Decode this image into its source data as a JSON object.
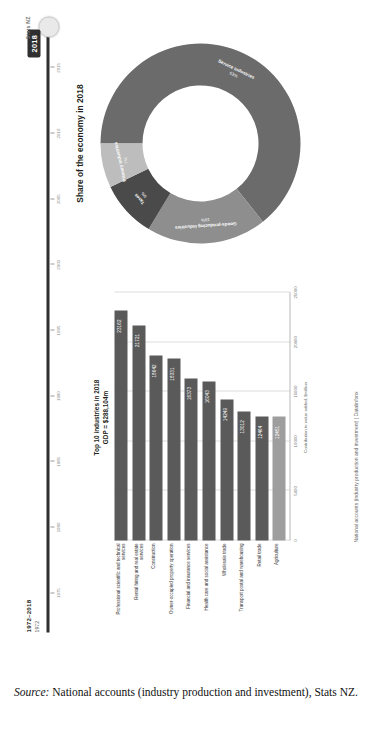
{
  "timeline": {
    "range_label": "1972–2018",
    "start_year": "1972",
    "selected_year": "2018",
    "ticks": [
      "1975",
      "1980",
      "1985",
      "1990",
      "1995",
      "2000",
      "2005",
      "2010",
      "2015"
    ]
  },
  "bar_chart": {
    "title_line1": "Top 10 industries in 2018",
    "title_line2": "GDP = $288,104m",
    "xlabel": "Contribution to value added, $million",
    "xticks": [
      "0",
      "5000",
      "10000",
      "15000",
      "20000",
      "25000"
    ],
    "xmax": 25000
  },
  "chart_data": [
    {
      "type": "bar",
      "orientation": "horizontal",
      "title": "Top 10 industries in 2018  GDP = $288,104m",
      "xlabel": "Contribution to value added, $million",
      "ylabel": "",
      "xlim": [
        0,
        25000
      ],
      "grid": true,
      "categories": [
        "Professional scientific and technical services",
        "Rental hiring and real estate services",
        "Construction",
        "Owner-occupied property operation",
        "Financial and insurance services",
        "Health care and social assistance",
        "Wholesale trade",
        "Transport postal and warehousing",
        "Retail trade",
        "Agriculture"
      ],
      "values": [
        23162,
        21721,
        18642,
        18331,
        16373,
        16043,
        14249,
        13012,
        12464,
        12451
      ],
      "value_labels": [
        "23162",
        "21721",
        "18642",
        "18331",
        "16373",
        "16043",
        "14249",
        "13012",
        "12464",
        "12451"
      ],
      "highlight_index": 9,
      "colors": {
        "bar": "#5a5a5a",
        "highlight": "#9e9e9e"
      }
    },
    {
      "type": "pie",
      "variant": "donut",
      "title": "Share of the economy in 2018",
      "legend": "labels-on-slices",
      "labels": [
        "Service industries",
        "Goods-producing industries",
        "Taxes",
        "Primary industries"
      ],
      "values": [
        63,
        19,
        9,
        7
      ],
      "value_labels": [
        "63%",
        "19%",
        "9%",
        "7%"
      ],
      "colors": [
        "#6b6b6b",
        "#8e8e8e",
        "#4a4a4a",
        "#bdbdbd"
      ]
    }
  ],
  "footer": {
    "infographic_note": "National accounts (industry production and investment) | Datalinfonx",
    "brand": "Stats NZ"
  },
  "caption": {
    "source_label": "Source:",
    "source_text": " National accounts (industry production and investment), Stats NZ."
  }
}
